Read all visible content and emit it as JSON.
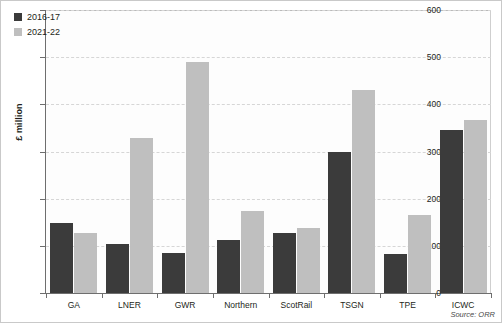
{
  "chart_data": {
    "type": "bar",
    "title": "",
    "subtitle": "",
    "xlabel": "",
    "ylabel": "£ million",
    "ylim": [
      0,
      600
    ],
    "yticks": [
      0,
      100,
      200,
      300,
      400,
      500,
      600
    ],
    "grid": true,
    "legend_position": "top-left",
    "categories": [
      "GA",
      "LNER",
      "GWR",
      "Northern",
      "ScotRail",
      "TSGN",
      "TPE",
      "ICWC"
    ],
    "series": [
      {
        "name": "2016-17",
        "color": "#3b3b3b",
        "values": [
          148,
          104,
          85,
          113,
          127,
          298,
          83,
          345
        ]
      },
      {
        "name": "2021-22",
        "color": "#bfbfbf",
        "values": [
          127,
          328,
          490,
          174,
          138,
          431,
          165,
          366
        ]
      }
    ],
    "source": "Source: ORR"
  }
}
